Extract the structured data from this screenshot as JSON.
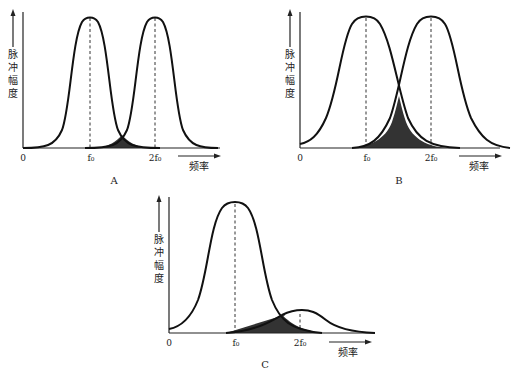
{
  "panels": [
    {
      "id": "A",
      "label": "A",
      "y_axis_label": [
        "脉",
        "冲",
        "幅",
        "度"
      ],
      "x_axis_label": "频率",
      "ticks": [
        "0",
        "f₀",
        "2f₀"
      ],
      "description": "Two narrow, equal-height peaks at f0 and 2f0 with small overlap (shaded)"
    },
    {
      "id": "B",
      "label": "B",
      "y_axis_label": [
        "脉",
        "冲",
        "幅",
        "度"
      ],
      "x_axis_label": "频率",
      "ticks": [
        "0",
        "f₀",
        "2f₀"
      ],
      "description": "Two wide, equal-height peaks at f0 and 2f0 with large overlap (shaded)"
    },
    {
      "id": "C",
      "label": "C",
      "y_axis_label": [
        "脉",
        "冲",
        "幅",
        "度"
      ],
      "x_axis_label": "频率",
      "ticks": [
        "0",
        "f₀",
        "2f₀"
      ],
      "description": "Tall wide peak at f0 and small low peak at 2f0; overlap region shaded"
    }
  ]
}
